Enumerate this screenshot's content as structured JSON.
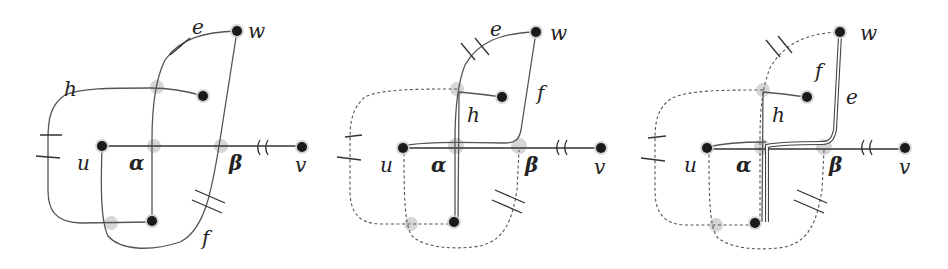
{
  "figure": {
    "panels": [
      {
        "id": "panel-1",
        "labels": {
          "e": "e",
          "w": "w",
          "h": "h",
          "u": "u",
          "alpha": "α",
          "beta": "β",
          "v": "v",
          "f": "f"
        }
      },
      {
        "id": "panel-2",
        "labels": {
          "e": "e",
          "w": "w",
          "h": "h",
          "f": "f",
          "u": "u",
          "alpha": "α",
          "beta": "β",
          "v": "v"
        }
      },
      {
        "id": "panel-3",
        "labels": {
          "w": "w",
          "f": "f",
          "e": "e",
          "h": "h",
          "u": "u",
          "alpha": "α",
          "beta": "β",
          "v": "v"
        }
      }
    ],
    "colors": {
      "node": "#1a1a1a",
      "halo": "#cfcfcf",
      "edge": "#555555"
    }
  }
}
